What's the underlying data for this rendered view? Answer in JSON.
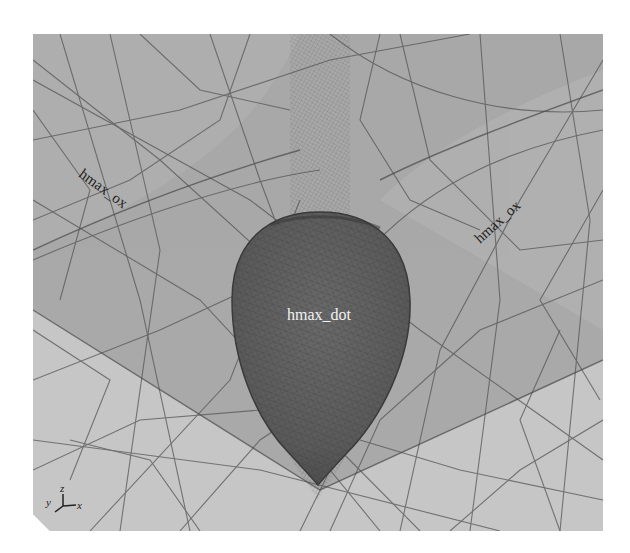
{
  "viewport": {
    "background": "#ffffff",
    "panel_color": "#a9a9a9",
    "upper_region_color": "#a4a4a4",
    "lower_region_color": "#c4c4c4",
    "dot_color": "#5e5e5e",
    "mesh_line_color": "#555555"
  },
  "labels": {
    "left_region": "hmax_ox",
    "right_region": "hmax_ox",
    "center_region": "hmax_dot"
  },
  "axis_triad": {
    "x": "x",
    "y": "y",
    "z": "z"
  }
}
